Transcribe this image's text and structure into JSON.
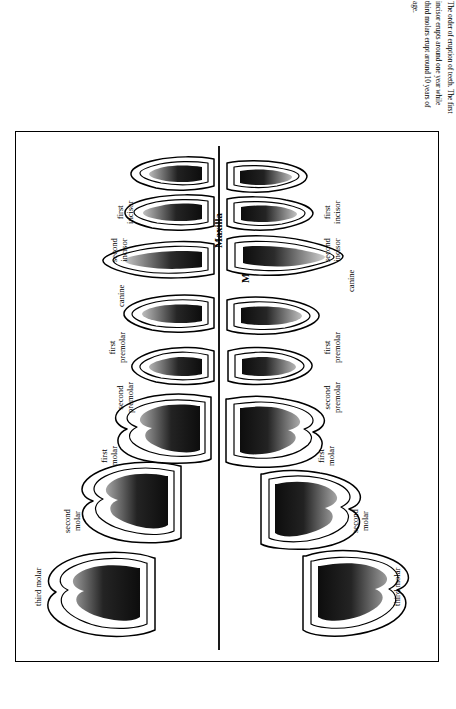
{
  "caption": {
    "text": "The order of eruption of teeth. The first incisor erupts around one year while third molars erupt around 10 years of age."
  },
  "figure": {
    "title": "",
    "jaws": [
      {
        "id": "maxilla",
        "label": "Maxilla"
      },
      {
        "id": "mandible",
        "label": "Mandible"
      }
    ],
    "maxilla_teeth": [
      {
        "id": "max-third-molar",
        "label": "third molar",
        "lines": [
          "third molar"
        ]
      },
      {
        "id": "max-second-molar",
        "label": "second molar",
        "lines": [
          "second",
          "molar"
        ]
      },
      {
        "id": "max-first-molar",
        "label": "first molar",
        "lines": [
          "first",
          "molar"
        ]
      },
      {
        "id": "max-second-premolar",
        "label": "second premolar",
        "lines": [
          "second",
          "premolar"
        ]
      },
      {
        "id": "max-first-premolar",
        "label": "first premolar",
        "lines": [
          "first",
          "premolar"
        ]
      },
      {
        "id": "max-canine",
        "label": "canine",
        "lines": [
          "canine"
        ]
      },
      {
        "id": "max-second-incisor",
        "label": "second incisor",
        "lines": [
          "second",
          "incisor"
        ]
      },
      {
        "id": "max-first-incisor",
        "label": "first incisor",
        "lines": [
          "first",
          "incisor"
        ]
      }
    ],
    "mandible_teeth": [
      {
        "id": "man-third-molar",
        "label": "third molar",
        "lines": [
          "third molar"
        ]
      },
      {
        "id": "man-second-molar",
        "label": "second molar",
        "lines": [
          "second",
          "molar"
        ]
      },
      {
        "id": "man-first-molar",
        "label": "first molar",
        "lines": [
          "first",
          "molar"
        ]
      },
      {
        "id": "man-second-premolar",
        "label": "second premolar",
        "lines": [
          "second",
          "premolar"
        ]
      },
      {
        "id": "man-first-premolar",
        "label": "first premolar",
        "lines": [
          "first",
          "premolar"
        ]
      },
      {
        "id": "man-canine",
        "label": "canine",
        "lines": [
          "canine"
        ]
      },
      {
        "id": "man-second-incisor",
        "label": "second incisor",
        "lines": [
          "second",
          "incisor"
        ]
      },
      {
        "id": "man-first-incisor",
        "label": "first incisor",
        "lines": [
          "first",
          "incisor"
        ]
      }
    ]
  },
  "colors": {
    "ink": "#000000",
    "pulp_dark": "#111111",
    "pulp_mid": "#6b6b6b",
    "background": "#ffffff"
  }
}
